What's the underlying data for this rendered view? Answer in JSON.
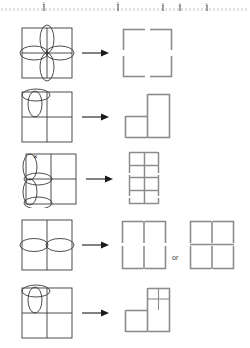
{
  "document": {
    "title": "Shape Transformation Figure",
    "ruler": {
      "name": "measurement-ruler",
      "major_tick_labels": [
        "1",
        "2",
        "3",
        "4",
        "5"
      ],
      "tick_color": "#9a9a9a"
    },
    "colors": {
      "input_stroke": "#3a3a3a",
      "output_stroke": "#8c8c8c",
      "arrow": "#1a1a1a",
      "text": "#333333",
      "background": "#ffffff"
    }
  },
  "rows": [
    {
      "id": "row-1",
      "input": {
        "name": "input-grid-flower",
        "description": "2x2 grid with four petal ellipses forming a flower at center",
        "grid": {
          "cols": 2,
          "rows": 2
        },
        "ellipses": [
          {
            "name": "petal-top",
            "orientation": "vertical"
          },
          {
            "name": "petal-bottom",
            "orientation": "vertical"
          },
          {
            "name": "petal-left",
            "orientation": "horizontal"
          },
          {
            "name": "petal-right",
            "orientation": "horizontal"
          }
        ]
      },
      "arrow": {
        "name": "transform-arrow",
        "glyph": "→"
      },
      "outputs": [
        {
          "name": "output-single-square",
          "description": "one plain square with gapped edges",
          "cells": [
            [
              1
            ]
          ]
        }
      ],
      "connector_label": ""
    },
    {
      "id": "row-2",
      "input": {
        "name": "input-grid-cylinder",
        "description": "2x2 grid with a cylinder (two ellipses) in the top-left cell",
        "grid": {
          "cols": 2,
          "rows": 2
        },
        "ellipses": [
          {
            "name": "cylinder-top-ellipse",
            "orientation": "horizontal"
          },
          {
            "name": "cylinder-side-ellipse",
            "orientation": "vertical"
          }
        ]
      },
      "arrow": {
        "name": "transform-arrow",
        "glyph": "→"
      },
      "outputs": [
        {
          "name": "output-l-tromino",
          "description": "L-shaped tromino: top-right, bottom-left, bottom-right",
          "cells": [
            [
              0,
              1
            ],
            [
              1,
              1
            ]
          ]
        }
      ],
      "connector_label": ""
    },
    {
      "id": "row-3",
      "input": {
        "name": "input-grid-stacked-ellipses",
        "description": "2x2 grid with tall vertical ellipse on the left column, two horizontal ellipses, and an x mark at top",
        "grid": {
          "cols": 2,
          "rows": 2
        },
        "mark": {
          "name": "x-mark",
          "glyph": "×"
        },
        "ellipses": [
          {
            "name": "tall-ellipse-upper",
            "orientation": "vertical"
          },
          {
            "name": "tall-ellipse-lower",
            "orientation": "vertical"
          },
          {
            "name": "mid-ellipse",
            "orientation": "horizontal"
          },
          {
            "name": "bottom-ellipse",
            "orientation": "horizontal"
          }
        ]
      },
      "arrow": {
        "name": "transform-arrow",
        "glyph": "→"
      },
      "outputs": [
        {
          "name": "output-2x4-grid",
          "description": "grid of 2 columns by 4 rows of small squares",
          "cols": 2,
          "rows": 4
        }
      ],
      "connector_label": ""
    },
    {
      "id": "row-4",
      "input": {
        "name": "input-two-columns-ellipses",
        "description": "two tall columns with two horizontal ellipses side by side across the middle",
        "grid": {
          "cols": 2,
          "rows": 1
        },
        "ellipses": [
          {
            "name": "left-ellipse",
            "orientation": "horizontal"
          },
          {
            "name": "right-ellipse",
            "orientation": "horizontal"
          }
        ]
      },
      "arrow": {
        "name": "transform-arrow",
        "glyph": "→"
      },
      "outputs": [
        {
          "name": "output-two-tall-cells",
          "description": "two tall cells side by side",
          "cols": 2,
          "rows": 1
        },
        {
          "name": "output-2x2-grid",
          "description": "2 by 2 grid of squares",
          "cols": 2,
          "rows": 2
        }
      ],
      "connector_label": "or"
    },
    {
      "id": "row-5",
      "input": {
        "name": "input-grid-cylinder-2",
        "description": "2x2 grid with a cylinder (two ellipses) in the top-left cell",
        "grid": {
          "cols": 2,
          "rows": 2
        },
        "ellipses": [
          {
            "name": "cylinder-top-ellipse",
            "orientation": "horizontal"
          },
          {
            "name": "cylinder-side-ellipse",
            "orientation": "vertical"
          }
        ]
      },
      "arrow": {
        "name": "transform-arrow",
        "glyph": "→"
      },
      "outputs": [
        {
          "name": "output-l-tromino-subdivided",
          "description": "L-shaped tromino where the top-right square is subdivided into a 2x2 mini grid",
          "cells": [
            [
              0,
              1
            ],
            [
              1,
              1
            ]
          ],
          "subdivided_cell": {
            "row": 0,
            "col": 1,
            "cols": 2,
            "rows": 2
          }
        }
      ],
      "connector_label": ""
    }
  ]
}
